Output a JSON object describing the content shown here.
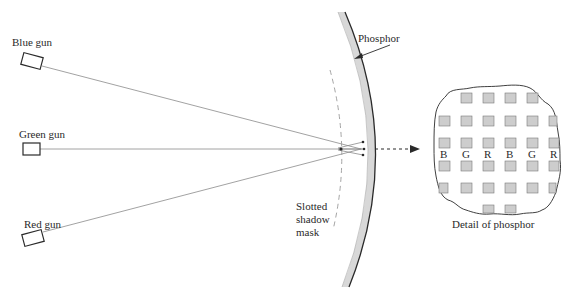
{
  "diagram": {
    "guns": [
      {
        "label": "Blue gun",
        "color_name": "blue"
      },
      {
        "label": "Green gun",
        "color_name": "green"
      },
      {
        "label": "Red gun",
        "color_name": "red"
      }
    ],
    "mask_label": "Slotted\nshadow\nmask",
    "phosphor_label": "Phosphor",
    "detail_caption": "Detail of phosphor",
    "detail_letters": [
      "B",
      "G",
      "R",
      "B",
      "G",
      "R"
    ],
    "colors": {
      "ink": "#2a2a2a",
      "beam": "#8a8a8a",
      "phosphor_fill": "#d8d8d8",
      "dot_fill": "#c8c8c8"
    }
  }
}
